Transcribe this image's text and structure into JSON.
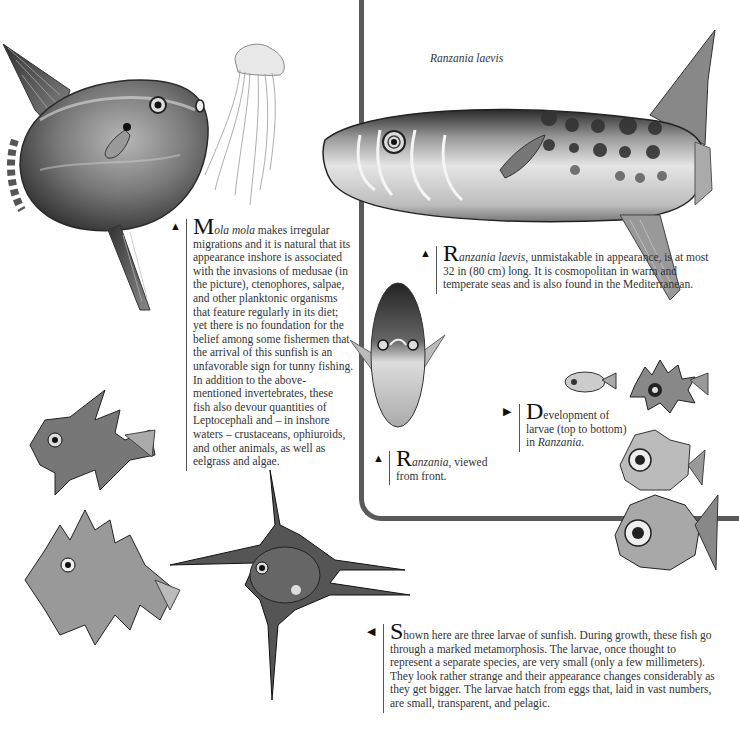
{
  "page": {
    "frame_color": "#5a5a5a",
    "text_color": "#333333"
  },
  "illustrations": {
    "mola_mola": {
      "label": "Mola mola illustration"
    },
    "jellyfish": {
      "label": "Medusa illustration"
    },
    "ranzania_laevis": {
      "label": "Ranzania laevis side view",
      "title": "Ranzania laevis"
    },
    "ranzania_front": {
      "label": "Ranzania viewed from front"
    },
    "larvae_development": {
      "label": "Development of larvae in Ranzania"
    },
    "sunfish_larvae": {
      "label": "Three larvae of sunfish"
    }
  },
  "captions": {
    "mola": {
      "arrow": "▲",
      "drop": "M",
      "italic_start": "ola mola",
      "text": " makes irregular migrations and it is natural that its appearance inshore is associated with the invasions of medusae (in the picture), ctenophores, salpae, and other planktonic organisms that feature regularly in its diet; yet there is no foundation for the belief among some fishermen that the arrival of this sunfish is an unfavorable sign for tunny fishing. In addition to the above-mentioned invertebrates, these fish also devour quantities of Leptocephali and – in inshore waters – crustaceans, ophiuroids, and other animals, as well as eelgrass and algae."
    },
    "ranzania_laevis": {
      "arrow": "▲",
      "drop": "R",
      "italic_start": "anzania laevis",
      "text": ", unmistakable in appearance, is at most 32 in (80 cm) long. It is cosmopolitan in warm and temperate seas and is also found in the Mediterranean."
    },
    "ranzania_front": {
      "arrow": "▲",
      "drop": "R",
      "italic_start": "anzania",
      "text": ", viewed from front."
    },
    "development": {
      "arrow": "▶",
      "drop": "D",
      "first": "evelopment of larvae (top to bottom) in ",
      "italic_end": "Ranzania",
      "end": "."
    },
    "larvae": {
      "arrow": "◀",
      "drop": "S",
      "text": "hown here are three larvae of sunfish. During growth, these fish go through a marked metamorphosis. The larvae, once thought to represent a separate species, are very small (only a few millimeters). They look rather strange and their appearance changes considerably as they get bigger. The larvae hatch from eggs that, laid in vast numbers, are small, transparent, and pelagic."
    }
  }
}
